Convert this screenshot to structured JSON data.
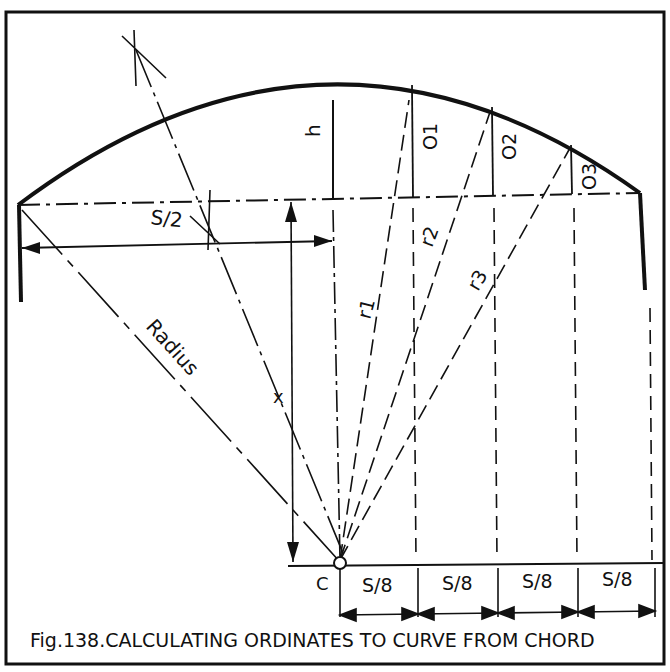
{
  "figure": {
    "caption": "Fig.138.CALCULATING ORDINATES TO CURVE FROM CHORD",
    "labels": {
      "half_span": "S/2",
      "rise": "h",
      "radius": "Radius",
      "x": "x",
      "center": "C",
      "ordinate_1": "O1",
      "ordinate_2": "O2",
      "ordinate_3": "O3",
      "r1": "r1",
      "r2": "r2",
      "r3": "r3",
      "segments": [
        "S/8",
        "S/8",
        "S/8",
        "S/8"
      ]
    }
  }
}
